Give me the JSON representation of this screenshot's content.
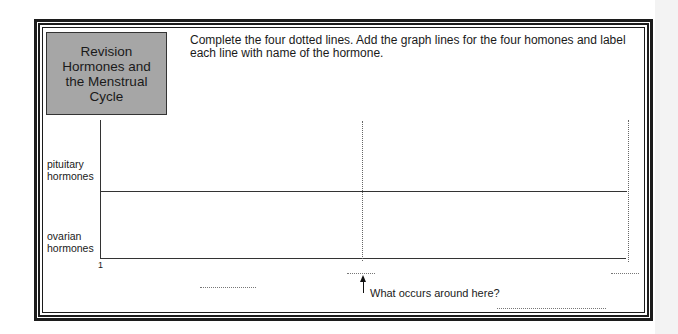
{
  "title_box": {
    "lines": [
      "Revision",
      "Hormones and",
      "the Menstrual",
      "Cycle"
    ],
    "background": "#a6a6a6"
  },
  "instructions": "Complete the four dotted lines. Add the graph lines for the four homones and label each line with name of the hormone.",
  "graph": {
    "y_labels": {
      "top": [
        "pituitary",
        "hormones"
      ],
      "bottom": [
        "ovarian",
        "hormones"
      ]
    },
    "x_start_label": "1",
    "annotation": "What occurs around here?",
    "dotted_answer_blanks": 4
  }
}
